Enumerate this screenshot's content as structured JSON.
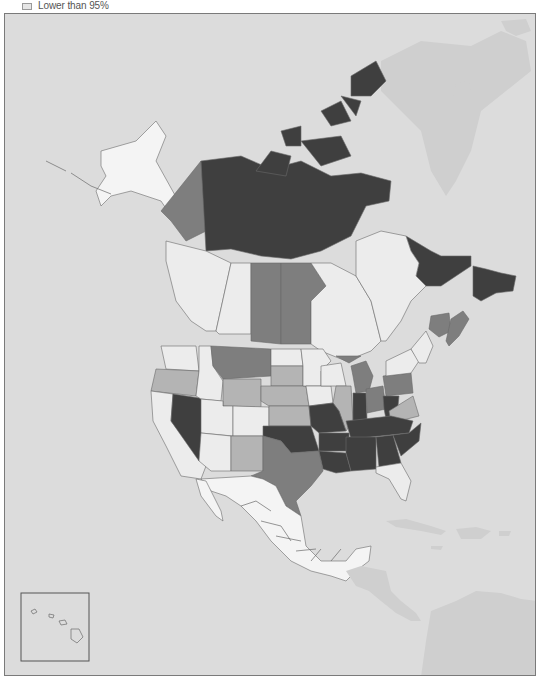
{
  "legend": {
    "items": [
      {
        "label": "Lower than 95%",
        "swatch_color": "#e6e6e6"
      }
    ]
  },
  "map": {
    "region": "North America",
    "shading_levels": {
      "darkest": "#3f3f3f",
      "medium": "#7e7e7e",
      "light": "#b4b4b4",
      "pale": "#ececec"
    },
    "ocean_color": "#dcdcdc",
    "non_data_land_color": "#cfcfcf",
    "shaded_regions": {
      "darkest": [
        "Nunavut",
        "Northwest Territories",
        "Newfoundland and Labrador",
        "Missouri",
        "Arkansas",
        "Louisiana",
        "Oklahoma (east)",
        "Tennessee",
        "Kentucky",
        "Indiana",
        "Mississippi",
        "Alabama",
        "Georgia",
        "South Carolina",
        "North Carolina",
        "West Virginia"
      ],
      "medium": [
        "Yukon",
        "Saskatchewan",
        "Manitoba",
        "Nevada",
        "Montana",
        "Michigan",
        "Ohio",
        "Pennsylvania",
        "Texas",
        "New Brunswick",
        "Nova Scotia"
      ],
      "light": [
        "Oregon",
        "Wyoming",
        "South Dakota",
        "Nebraska",
        "Kansas",
        "Illinois",
        "Virginia",
        "New Mexico",
        "Idaho (part)"
      ],
      "pale": [
        "Alaska",
        "British Columbia",
        "Alberta",
        "Ontario",
        "Quebec",
        "Washington",
        "California",
        "Utah",
        "Colorado",
        "Arizona",
        "North Dakota",
        "Minnesota",
        "Iowa",
        "Wisconsin",
        "New York",
        "New England",
        "Florida",
        "Mexico"
      ]
    },
    "inset": {
      "name": "Hawaii"
    }
  }
}
